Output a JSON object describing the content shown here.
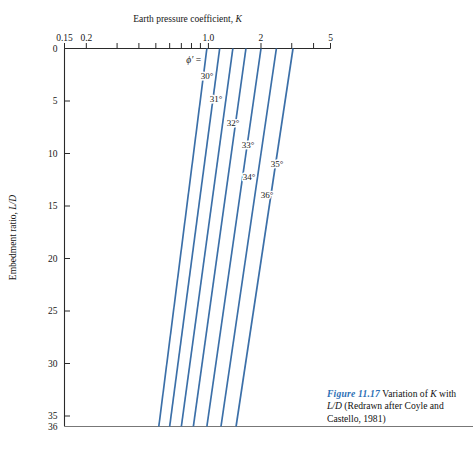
{
  "figure": {
    "caption_label": "Figure 11.17",
    "caption_text": " Variation of K with L/D (Redrawn after Coyle and Castello, 1981)",
    "caption_accent_color": "#2c6fb5"
  },
  "axes": {
    "x_title": "Earth pressure coefficient, K",
    "x_title_plain": "Earth pressure coefficient,",
    "x_title_symbol": "K",
    "y_title_plain": "Embedment ratio,",
    "y_title_symbol": "L/D",
    "x_scale": "log",
    "x_min": 0.15,
    "x_max": 5,
    "y_min": 0,
    "y_max": 36,
    "x_major_labels": [
      "0.15",
      "0.2",
      "1.0",
      "2",
      "5"
    ],
    "x_major_values": [
      0.15,
      0.2,
      1.0,
      2,
      5
    ],
    "x_tick_values": [
      0.15,
      0.2,
      0.3,
      0.4,
      0.5,
      0.6,
      0.7,
      0.8,
      0.9,
      1.0,
      2,
      3,
      4,
      5
    ],
    "y_tick_labels": [
      "0",
      "5",
      "10",
      "15",
      "20",
      "25",
      "30",
      "35",
      "36"
    ],
    "y_tick_values": [
      0,
      5,
      10,
      15,
      20,
      25,
      30,
      35,
      36
    ]
  },
  "chart_data": {
    "type": "line",
    "title": "",
    "xlabel": "Earth pressure coefficient, K",
    "ylabel": "Embedment ratio, L/D",
    "xlim": [
      0.15,
      5
    ],
    "ylim": [
      0,
      36
    ],
    "x_scale": "log",
    "y_scale": "linear",
    "y_inverted": true,
    "grid": false,
    "legend": "inline-labels",
    "line_color": "#3b6fa8",
    "annotation": "ϕ' =",
    "series": [
      {
        "name": "30°",
        "label": "30°",
        "points": [
          [
            0.98,
            0
          ],
          [
            0.52,
            36
          ]
        ]
      },
      {
        "name": "31°",
        "label": "31°",
        "points": [
          [
            1.16,
            0
          ],
          [
            0.6,
            36
          ]
        ]
      },
      {
        "name": "32°",
        "label": "32°",
        "points": [
          [
            1.38,
            0
          ],
          [
            0.7,
            36
          ]
        ]
      },
      {
        "name": "33°",
        "label": "33°",
        "points": [
          [
            1.64,
            0
          ],
          [
            0.82,
            36
          ]
        ]
      },
      {
        "name": "34°",
        "label": "34°",
        "points": [
          [
            2.0,
            0
          ],
          [
            0.98,
            36
          ]
        ]
      },
      {
        "name": "35°",
        "label": "35°",
        "points": [
          [
            2.45,
            0
          ],
          [
            1.18,
            36
          ]
        ]
      },
      {
        "name": "36°",
        "label": "36°",
        "points": [
          [
            3.05,
            0
          ],
          [
            1.44,
            36
          ]
        ]
      }
    ]
  }
}
